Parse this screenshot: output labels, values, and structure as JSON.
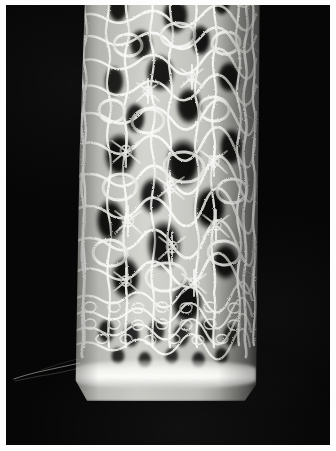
{
  "image": {
    "domain": "Natural-Image",
    "subject": "knitted-lace-fabric-macro",
    "caption": "Macro photograph of a strip of open knitted lace fabric photographed against a black backdrop",
    "width": 336,
    "height": 451,
    "orientation": "portrait",
    "has_text": false,
    "text_content": ""
  },
  "frame": {
    "border_color": "#fdfdfd",
    "border_width_px": 6,
    "field_color": "#040404"
  },
  "palette": {
    "background_black": "#040404",
    "backdrop_fuzz": "#151515",
    "yarn_highlight": "#fafaf6",
    "yarn_midtone": "#c9c9c4",
    "yarn_shadow": "#8a8a86",
    "lace_hole_dark": "#0a0a09",
    "lace_hole_mid": "#232321"
  },
  "subject_geometry": {
    "label": "lace-strip",
    "left_px": 62,
    "top_px": -14,
    "width_px": 192,
    "height_px": 410,
    "description": "vertical band spanning full height, slightly tapering and tilting left toward the bottom, cropped at the top edge of the frame"
  },
  "regions": [
    {
      "name": "upper-mesh",
      "description": "Open honeycomb lace mesh with medium irregular cells and visible yarn-overs",
      "y_range_px": [
        0,
        150
      ],
      "cell_scale": "medium"
    },
    {
      "name": "mid-mesh",
      "description": "Largest open lace holes with radiating star-like stitch clusters between them",
      "y_range_px": [
        150,
        300
      ],
      "cell_scale": "large"
    },
    {
      "name": "lower-dense-rows",
      "description": "Tighter regular rows of small stitches forming a dense horizontal band",
      "y_range_px": [
        300,
        370
      ],
      "cell_scale": "small"
    },
    {
      "name": "bind-off-edge",
      "description": "Bright compacted bound-off selvedge running across the bottom of the strip",
      "y_range_px": [
        370,
        395
      ],
      "cell_scale": "none"
    },
    {
      "name": "bottom-fringe",
      "description": "Soft fuzzy halo of loose mohair fibres below the bound-off edge",
      "y_range_px": [
        395,
        420
      ],
      "cell_scale": "none"
    }
  ],
  "details": [
    {
      "name": "stray-fiber",
      "description": "A single loose fibre trailing left off the fabric edge",
      "x_px": 8,
      "y_px": 366
    },
    {
      "name": "mohair-halo",
      "description": "Diffuse fuzzy glow of fine hairs surrounding both long edges of the strip"
    }
  ]
}
